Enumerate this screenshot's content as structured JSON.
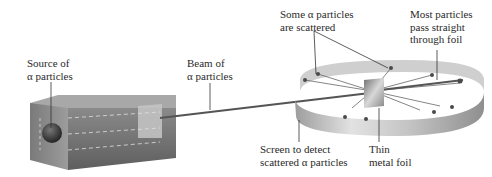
{
  "diagram": {
    "labels": {
      "source": [
        "Source of",
        "α particles"
      ],
      "beam": [
        "Beam of",
        "α particles"
      ],
      "scattered": [
        "Some α particles",
        "are scattered"
      ],
      "most_pass": [
        "Most particles",
        "pass straight",
        "through foil"
      ],
      "screen": [
        "Screen to detect",
        "scattered α particles"
      ],
      "foil": [
        "Thin",
        "metal foil"
      ]
    },
    "colors": {
      "box_front": "#6e6e6e",
      "box_top": "#9a9a9a",
      "ring": "#bdbdbd",
      "beam": "#555555",
      "dot": "#4a4a4a",
      "text": "#2a2a2a"
    }
  }
}
